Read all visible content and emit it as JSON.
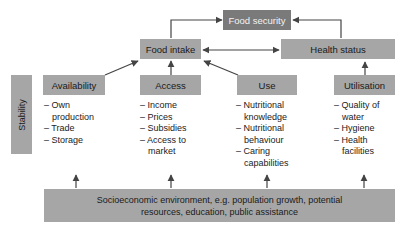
{
  "title": "Food security",
  "top_nodes": {
    "food_intake": "Food intake",
    "health_status": "Health status"
  },
  "stability_label": "Stability",
  "pillars": [
    {
      "label": "Availability",
      "items": [
        "Own production",
        "Trade",
        "Storage"
      ]
    },
    {
      "label": "Access",
      "items": [
        "Income",
        "Prices",
        "Subsidies",
        "Access to market"
      ]
    },
    {
      "label": "Use",
      "items": [
        "Nutritional knowledge",
        "Nutritional behaviour",
        "Caring capabilities"
      ]
    },
    {
      "label": "Utilisation",
      "items": [
        "Quality of water",
        "Hygiene",
        "Health facilities"
      ]
    }
  ],
  "environment": "Socioeconomic environment, e.g. population growth, potential resources, education, public assistance",
  "colors": {
    "box": "#a6a6a6",
    "title_box": "#7a7a7a",
    "arrow": "#444444"
  }
}
